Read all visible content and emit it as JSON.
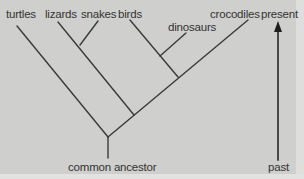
{
  "diagram": {
    "type": "cladogram",
    "taxa": [
      "turtles",
      "lizards",
      "snakes",
      "birds",
      "dinosaurs",
      "crocodiles"
    ],
    "root_label": "common ancestor",
    "time_axis": {
      "top_label": "present",
      "bottom_label": "past"
    },
    "line_color": "#3a3a3a",
    "background_color": "#cfcfcd"
  }
}
